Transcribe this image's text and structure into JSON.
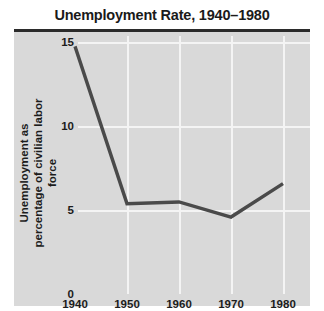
{
  "header": {
    "title": "Unemployment Rate, 1940–1980"
  },
  "chart_data": {
    "type": "line",
    "title": "Unemployment Rate, 1940–1980",
    "xlabel": "",
    "ylabel_lines": [
      "Unemployment as",
      "percentage of civilian labor force"
    ],
    "ylabel": "Unemployment as percentage of civilian labor force",
    "categories": [
      "1940",
      "1950",
      "1960",
      "1970",
      "1980"
    ],
    "x": [
      1940,
      1950,
      1960,
      1970,
      1980
    ],
    "values": [
      14.8,
      5.4,
      5.5,
      4.6,
      6.6
    ],
    "series": [
      {
        "name": "Unemployment rate",
        "values": [
          14.8,
          5.4,
          5.5,
          4.6,
          6.6
        ]
      }
    ],
    "xlim": [
      1940,
      1980
    ],
    "ylim": [
      0,
      15
    ],
    "xticks": [
      "1940",
      "1950",
      "1960",
      "1970",
      "1980"
    ],
    "yticks": [
      "0",
      "5",
      "10",
      "15"
    ],
    "ytick_values": [
      0,
      5,
      10,
      15
    ],
    "grid": true,
    "legend": false,
    "colors": {
      "line": "#4a4a4a",
      "panel_background": "#d9d9d9",
      "gridline": "#f4f4f4",
      "title_rule": "#2b2b2b",
      "text": "#1c1c1c",
      "page_background": "#ffffff"
    }
  }
}
